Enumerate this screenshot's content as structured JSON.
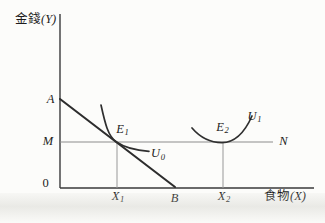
{
  "colors": {
    "line_dark": "#2d2d2d",
    "axis": "#3a3a3a",
    "line_gray": "#8c8c8c",
    "text": "#1c1c1c",
    "background": "#fcfcfa"
  },
  "figure": {
    "y_axis": {
      "cjk": "金錢",
      "var": "(Y)"
    },
    "x_axis": {
      "cjk": "食物",
      "var": "(X)"
    },
    "origin_label": "0",
    "points": {
      "a": "A",
      "m": "M",
      "n": "N",
      "b": "B",
      "e1": {
        "base": "E",
        "sub": "1"
      },
      "e2": {
        "base": "E",
        "sub": "2"
      },
      "x1": {
        "base": "X",
        "sub": "1"
      },
      "x2": {
        "base": "X",
        "sub": "2"
      }
    },
    "curves": {
      "u0": {
        "base": "U",
        "sub": "0"
      },
      "u1": {
        "base": "U",
        "sub": "1"
      }
    }
  }
}
